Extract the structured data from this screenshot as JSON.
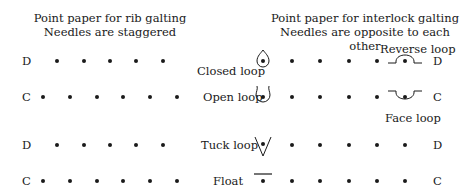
{
  "left_panel": {
    "title_line1": "Point paper for rib galting",
    "title_line2": "Needles are staggered",
    "rows": [
      {
        "label": "D",
        "y": 61,
        "dots_x": [
          57,
          84,
          110,
          136,
          163
        ]
      },
      {
        "label": "C",
        "y": 97,
        "dots_x": [
          43,
          70,
          97,
          123,
          150,
          177
        ]
      },
      {
        "label": "D",
        "y": 145,
        "dots_x": [
          57,
          84,
          110,
          136,
          163
        ]
      },
      {
        "label": "C",
        "y": 181,
        "dots_x": [
          43,
          70,
          97,
          123,
          150,
          177
        ]
      }
    ]
  },
  "right_panel": {
    "title_line1": "Point paper for interlock galting",
    "title_line2": "Needles are opposite to each other",
    "rows": [
      {
        "label": "D",
        "y": 61
      },
      {
        "label": "C",
        "y": 97
      },
      {
        "label": "D",
        "y": 145
      },
      {
        "label": "C",
        "y": 181
      }
    ],
    "dots_x": [
      292,
      320,
      349,
      377
    ]
  },
  "legend": {
    "closed_loop": "Closed loop",
    "open_loop": "Open loop",
    "tuck_loop": "Tuck loop",
    "float": "Float",
    "reverse_loop": "Reverse loop",
    "face_loop": "Face loop"
  }
}
